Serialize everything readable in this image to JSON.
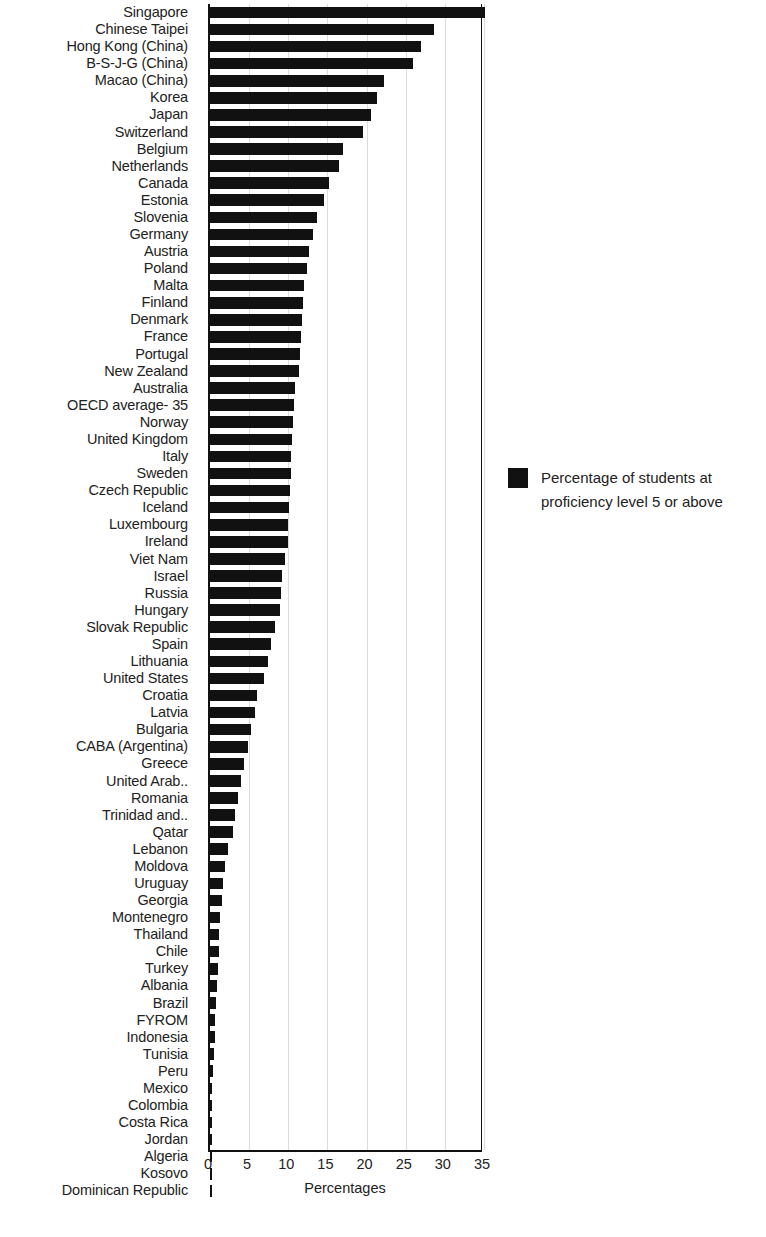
{
  "chart_data": {
    "type": "bar",
    "orientation": "horizontal",
    "title": "",
    "xlabel": "Percentages",
    "ylabel": "",
    "xlim": [
      0,
      35
    ],
    "xticks": [
      0,
      5,
      10,
      15,
      20,
      25,
      30,
      35
    ],
    "grid": true,
    "legend_position": "right",
    "bar_color": "#111111",
    "series": [
      {
        "name": "Percentage of students at proficiency level 5 or above",
        "values": [
          35.1,
          28.6,
          26.9,
          25.9,
          22.2,
          21.3,
          20.6,
          19.6,
          17.0,
          16.5,
          15.2,
          14.5,
          13.7,
          13.2,
          12.6,
          12.4,
          12.0,
          11.9,
          11.7,
          11.6,
          11.5,
          11.4,
          10.9,
          10.7,
          10.6,
          10.5,
          10.4,
          10.4,
          10.2,
          10.1,
          10.0,
          9.9,
          9.6,
          9.2,
          9.1,
          8.9,
          8.3,
          7.8,
          7.4,
          6.9,
          6.0,
          5.7,
          5.3,
          4.8,
          4.3,
          3.9,
          3.6,
          3.2,
          2.9,
          2.3,
          1.9,
          1.7,
          1.5,
          1.3,
          1.2,
          1.1,
          1.0,
          0.9,
          0.8,
          0.7,
          0.6,
          0.5,
          0.4,
          0.3,
          0.3,
          0.2,
          0.2,
          0.1,
          0.1,
          0.1
        ]
      }
    ],
    "categories": [
      "Singapore",
      "Chinese Taipei",
      "Hong Kong (China)",
      "B-S-J-G (China)",
      "Macao (China)",
      "Korea",
      "Japan",
      "Switzerland",
      "Belgium",
      "Netherlands",
      "Canada",
      "Estonia",
      "Slovenia",
      "Germany",
      "Austria",
      "Poland",
      "Malta",
      "Finland",
      "Denmark",
      "France",
      "Portugal",
      "New Zealand",
      "Australia",
      "OECD average- 35",
      "Norway",
      "United Kingdom",
      "Italy",
      "Sweden",
      "Czech Republic",
      "Iceland",
      "Luxembourg",
      "Ireland",
      "Viet Nam",
      "Israel",
      "Russia",
      "Hungary",
      "Slovak Republic",
      "Spain",
      "Lithuania",
      "United States",
      "Croatia",
      "Latvia",
      "Bulgaria",
      "CABA (Argentina)",
      "Greece",
      "United Arab..",
      "Romania",
      "Trinidad and..",
      "Qatar",
      "Lebanon",
      "Moldova",
      "Uruguay",
      "Georgia",
      "Montenegro",
      "Thailand",
      "Chile",
      "Turkey",
      "Albania",
      "Brazil",
      "FYROM",
      "Indonesia",
      "Tunisia",
      "Peru",
      "Mexico",
      "Colombia",
      "Costa Rica",
      "Jordan",
      "Algeria",
      "Kosovo",
      "Dominican Republic"
    ]
  },
  "legend": {
    "label": "Percentage of students at proficiency level 5 or above"
  },
  "axis": {
    "x_title": "Percentages",
    "tick_labels": [
      "0",
      "5",
      "10",
      "15",
      "20",
      "25",
      "30",
      "35"
    ]
  }
}
